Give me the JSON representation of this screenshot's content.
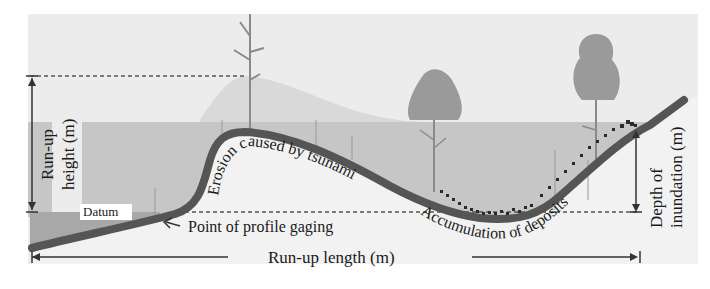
{
  "diagram": {
    "labels": {
      "runup_height_line1": "Run-up",
      "runup_height_line2": "height (m)",
      "datum": "Datum",
      "erosion": "Erosion caused by tsunami",
      "point_of_profile_gaging": "Point of profile gaging",
      "accumulation": "Accumulation of deposits",
      "depth_line1": "Depth of",
      "depth_line2": "inundation (m)",
      "runup_length": "Run-up length (m)"
    },
    "colors": {
      "background": "#ffffff",
      "sky_panel": "#ececec",
      "run_up_zone": "#d9d9d9",
      "water_band": "#c4c4c4",
      "sea": "#a8a8a8",
      "ground_fill": "#efefef",
      "ground_line": "#555555",
      "tree_canopy": "#9a9a9a",
      "tree_trunk": "#8a8a8a",
      "deposits": "#2a2a2a",
      "arrow": "#333333",
      "dashed": "#555555"
    }
  }
}
